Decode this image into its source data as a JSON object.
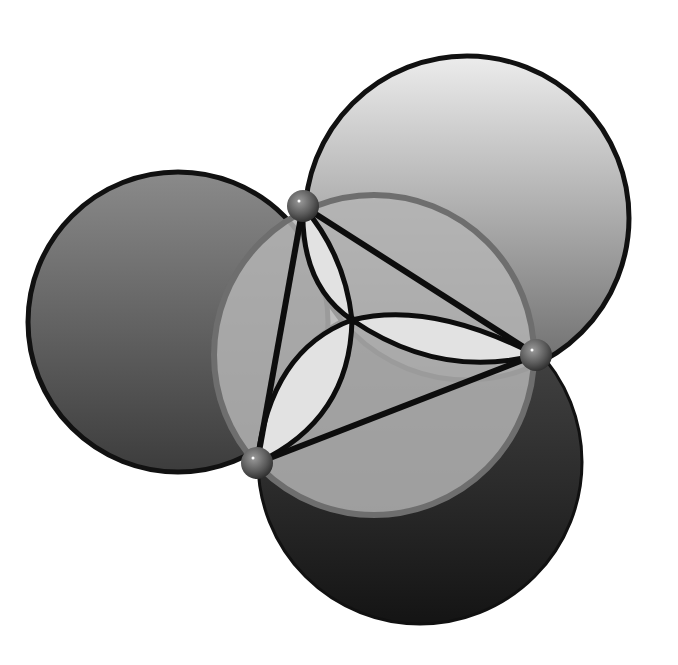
{
  "diagram": {
    "title": "Johnson's three congruent circles",
    "background": "#ffffff",
    "circles": [
      {
        "name": "left-circle",
        "cx": 178,
        "cy": 322,
        "r": 150,
        "fill_top": "#8a8a8a",
        "fill_bottom": "#3c3c3c",
        "stroke": "#111111"
      },
      {
        "name": "upper-right-circle",
        "cx": 467,
        "cy": 218,
        "r": 162,
        "fill_top": "#e6e6e6",
        "fill_bottom": "#6a6a6a",
        "stroke": "#111111"
      },
      {
        "name": "bottom-circle",
        "cx": 420,
        "cy": 462,
        "r": 162,
        "fill_top": "#4a4a4a",
        "fill_bottom": "#151515",
        "stroke": "#111111"
      },
      {
        "name": "middle-circle",
        "cx": 374,
        "cy": 355,
        "r": 160,
        "fill": "#b4b4b4",
        "stroke": "#6e6e6e"
      }
    ],
    "points": [
      {
        "name": "point-a",
        "x": 303,
        "y": 206
      },
      {
        "name": "point-b",
        "x": 536,
        "y": 355
      },
      {
        "name": "point-c",
        "x": 257,
        "y": 463
      }
    ],
    "center_point": {
      "x": 352,
      "y": 320
    },
    "lens_fill": "#e2e2e2",
    "line_color": "#0d0d0d"
  }
}
